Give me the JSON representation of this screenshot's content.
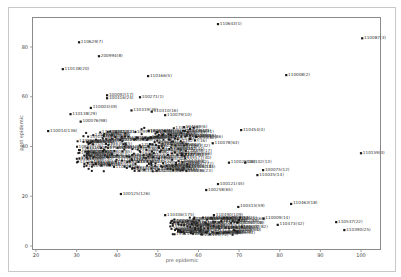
{
  "chart_data": {
    "type": "scatter",
    "title": "",
    "xlabel": "pre epidemic",
    "ylabel": "post epidemic",
    "xlim": [
      19,
      101
    ],
    "ylim": [
      -1,
      92
    ],
    "xticks": [
      20,
      30,
      40,
      50,
      60,
      70,
      80,
      90,
      100
    ],
    "yticks": [
      0,
      20,
      40,
      60,
      80
    ],
    "grid": false,
    "legend": null,
    "marker_color": "#1a1a1a",
    "points": [
      {
        "label": "110643(1)",
        "x": 64.8,
        "y": 89.2
      },
      {
        "label": "110087(3)",
        "x": 100.3,
        "y": 83.5
      },
      {
        "label": "110629(7)",
        "x": 30.6,
        "y": 81.9
      },
      {
        "label": "200994(8)",
        "x": 35.5,
        "y": 76.3
      },
      {
        "label": "110138(20)",
        "x": 26.6,
        "y": 71.1
      },
      {
        "label": "110166(5)",
        "x": 47.6,
        "y": 68.3
      },
      {
        "label": "110008(2)",
        "x": 81.6,
        "y": 68.7
      },
      {
        "label": "100092(17)",
        "x": 37.5,
        "y": 60.6
      },
      {
        "label": "100416(24)",
        "x": 37.5,
        "y": 59.4
      },
      {
        "label": "100271(1)",
        "x": 45.6,
        "y": 59.8
      },
      {
        "label": "110003(49)",
        "x": 33.5,
        "y": 55.5
      },
      {
        "label": "110319(30)",
        "x": 43.5,
        "y": 54.5
      },
      {
        "label": "110310(16)",
        "x": 48.5,
        "y": 54.0
      },
      {
        "label": "110138(29)",
        "x": 28.5,
        "y": 53.0
      },
      {
        "label": "110079(10)",
        "x": 51.8,
        "y": 52.6
      },
      {
        "label": "100076(98)",
        "x": 31.0,
        "y": 50.0
      },
      {
        "label": "110014(136)",
        "x": 23.0,
        "y": 46.2
      },
      {
        "label": "110454(4)",
        "x": 70.5,
        "y": 46.6
      },
      {
        "label": "110078(63)",
        "x": 63.5,
        "y": 41.3
      },
      {
        "label": "110018(23)",
        "x": 56.0,
        "y": 36.5
      },
      {
        "label": "110159(3)",
        "x": 100.0,
        "y": 37.3
      },
      {
        "label": "110028(16)",
        "x": 67.5,
        "y": 33.5
      },
      {
        "label": "100102(13)",
        "x": 71.5,
        "y": 33.5
      },
      {
        "label": "100075(12)",
        "x": 75.9,
        "y": 30.5
      },
      {
        "label": "110035(14)",
        "x": 74.5,
        "y": 28.5
      },
      {
        "label": "100121(45)",
        "x": 64.8,
        "y": 24.9
      },
      {
        "label": "100258(65)",
        "x": 61.9,
        "y": 22.5
      },
      {
        "label": "100125(126)",
        "x": 40.9,
        "y": 20.9
      },
      {
        "label": "100315(59)",
        "x": 69.8,
        "y": 15.7
      },
      {
        "label": "110463(18)",
        "x": 82.8,
        "y": 16.9
      },
      {
        "label": "110406(175)",
        "x": 51.8,
        "y": 12.4
      },
      {
        "label": "110490(109)",
        "x": 63.8,
        "y": 12.4
      },
      {
        "label": "110537(22)",
        "x": 93.9,
        "y": 9.6
      },
      {
        "label": "110390(25)",
        "x": 95.9,
        "y": 6.4
      },
      {
        "label": "110473(42)",
        "x": 79.5,
        "y": 8.5
      },
      {
        "label": "110500(60)",
        "x": 70.0,
        "y": 10.5
      },
      {
        "label": "110009(14)",
        "x": 76.0,
        "y": 11.0
      }
    ],
    "cluster_note": "Dense overlapping cluster of several hundred labeled points roughly x 28-80, y 25-52 and x 52-80, y 3-13"
  }
}
